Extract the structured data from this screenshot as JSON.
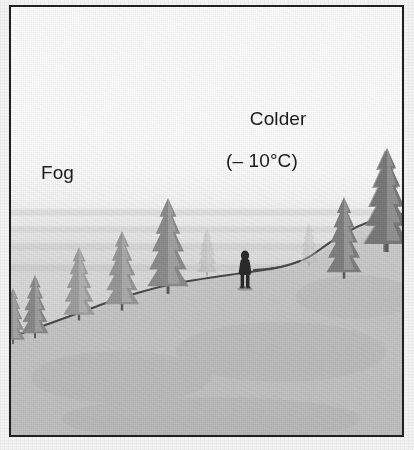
{
  "figure": {
    "name": "fog-valley-temperature-inversion-illustration",
    "frame": {
      "border_color": "#231f20",
      "background_color": "#ffffff"
    },
    "labels": {
      "colder": "Colder",
      "colder_temperature": "(– 10°C)",
      "fog": "Fog"
    },
    "scene": {
      "sky_description": "white sky fading to gray fog bank",
      "fog_color": "#d8d8d8",
      "ground_color": "#c9c9c9",
      "ridge_line_color": "#4a4a4a",
      "tree_color_near": "#6e6e6e",
      "tree_color_far": "#a9a9a9",
      "figure_color": "#2a2a2a",
      "elements": {
        "hillside": "slope rising left-to-right with a flat plateau at center",
        "person": "single standing human figure on the plateau",
        "trees": "conifer/fir trees along the slope and upper ridge"
      }
    }
  }
}
